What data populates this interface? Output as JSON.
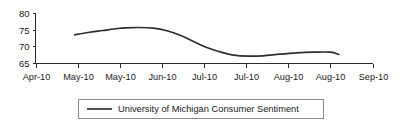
{
  "chart_data": {
    "type": "line",
    "title": "",
    "xlabel": "",
    "ylabel": "",
    "ylim": [
      65,
      80
    ],
    "y_ticks": [
      "65",
      "70",
      "75",
      "80"
    ],
    "y_tick_values": [
      65,
      70,
      75,
      80
    ],
    "grid": false,
    "legend_position": "bottom-center",
    "categories": [
      "Apr-10",
      "May-10",
      "May-10",
      "Jun-10",
      "Jul-10",
      "Jul-10",
      "Aug-10",
      "Aug-10",
      "Sep-10"
    ],
    "series": [
      {
        "name": "University of Michigan Consumer Sentiment",
        "color": "#2e2e2e",
        "x": [
          0.93,
          1.25,
          1.6,
          1.95,
          2.15,
          2.45,
          2.8,
          3.1,
          3.45,
          3.8,
          4.05,
          4.35,
          4.7,
          5.05,
          5.4,
          5.8,
          6.2,
          6.6,
          7.0,
          7.2
        ],
        "values": [
          73.6,
          74.3,
          74.9,
          75.5,
          75.7,
          75.8,
          75.6,
          74.9,
          73.4,
          71.3,
          69.9,
          68.6,
          67.5,
          67.2,
          67.3,
          67.8,
          68.2,
          68.4,
          68.4,
          67.7
        ]
      }
    ],
    "legend_entries": [
      "University of Michigan Consumer Sentiment"
    ]
  },
  "legend": {
    "label": "University of Michigan Consumer Sentiment"
  }
}
